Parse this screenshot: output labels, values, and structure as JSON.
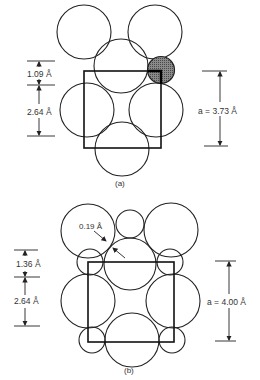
{
  "figure_a": {
    "caption": "(a)",
    "dim_top_left": "1.09 Å",
    "dim_bottom_left": "2.64 Å",
    "lattice_label": "a = 3.73 Å",
    "shaded_atom_color": "#6e6e6e"
  },
  "figure_b": {
    "caption": "(b)",
    "gap_label": "0.19 Å",
    "dim_top_left": "1.36 Å",
    "dim_bottom_left": "2.64 Å",
    "lattice_label": "a = 4.00 Å"
  },
  "colors": {
    "line": "#222222",
    "background": "#ffffff"
  }
}
